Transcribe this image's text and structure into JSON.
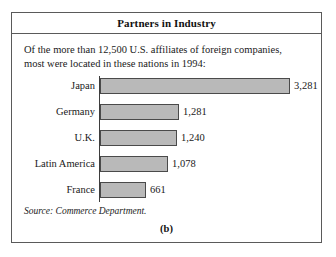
{
  "figure": {
    "title": "Partners in Industry",
    "subtitle": "Of the more than 12,500 U.S. affiliates of foreign companies, most were located in these nations in 1994:",
    "source": "Source: Commerce Department.",
    "panel_label": "(b)",
    "bar_fill_color": "#b9b9b9",
    "bar_border_color": "#4a4a4a",
    "frame_color": "#5a5a5a",
    "background_color": "#ffffff"
  },
  "chart_data": {
    "type": "bar",
    "orientation": "horizontal",
    "title": "Partners in Industry",
    "subtitle": "Of the more than 12,500 U.S. affiliates of foreign companies, most were located in these nations in 1994:",
    "xlabel": "",
    "ylabel": "",
    "grid": false,
    "legend": false,
    "xlim": [
      0,
      3281
    ],
    "categories": [
      "Japan",
      "Germany",
      "U.K.",
      "Latin America",
      "France"
    ],
    "values": [
      3281,
      1281,
      1240,
      1078,
      661
    ],
    "value_labels": [
      "3,281",
      "1,281",
      "1,240",
      "1,078",
      "661"
    ],
    "source": "Source: Commerce Department.",
    "annotations": [
      "(b)"
    ]
  },
  "rows": [
    {
      "label": "Japan",
      "value": "3,281",
      "bar_width_px": 190,
      "top_px": 2
    },
    {
      "label": "Germany",
      "value": "1,281",
      "bar_width_px": 79,
      "top_px": 28
    },
    {
      "label": "U.K.",
      "value": "1,240",
      "bar_width_px": 77,
      "top_px": 54
    },
    {
      "label": "Latin America",
      "value": "1,078",
      "bar_width_px": 68,
      "top_px": 80
    },
    {
      "label": "France",
      "value": "661",
      "bar_width_px": 46,
      "top_px": 106
    }
  ]
}
